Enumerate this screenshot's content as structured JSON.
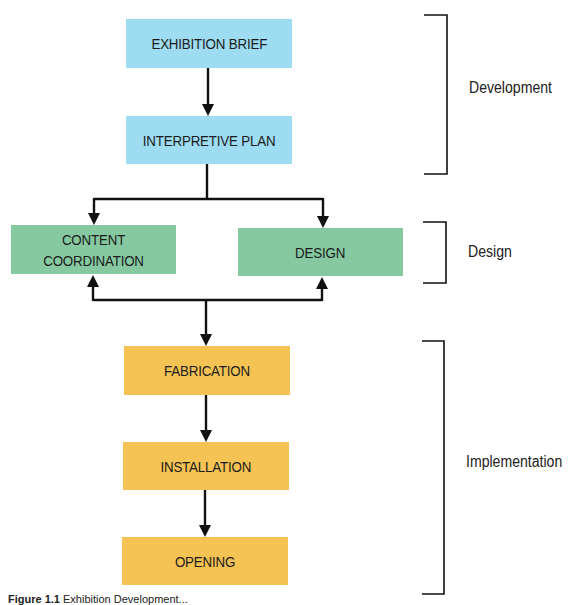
{
  "diagram": {
    "nodes": [
      {
        "id": "exhibition-brief",
        "label": "EXHIBITION BRIEF",
        "color": "#9edcf2"
      },
      {
        "id": "interpretive-plan",
        "label": "INTERPRETIVE PLAN",
        "color": "#9edcf2"
      },
      {
        "id": "content-coordination",
        "label": "CONTENT\nCOORDINATION",
        "color": "#86c9a1"
      },
      {
        "id": "design",
        "label": "DESIGN",
        "color": "#86c9a1"
      },
      {
        "id": "fabrication",
        "label": "FABRICATION",
        "color": "#f5c353"
      },
      {
        "id": "installation",
        "label": "INSTALLATION",
        "color": "#f5c353"
      },
      {
        "id": "opening",
        "label": "OPENING",
        "color": "#f5c353"
      }
    ],
    "edges": [
      {
        "from": "exhibition-brief",
        "to": "interpretive-plan"
      },
      {
        "from": "interpretive-plan",
        "to": "content-coordination"
      },
      {
        "from": "interpretive-plan",
        "to": "design"
      },
      {
        "from": "fabrication",
        "to": "content-coordination"
      },
      {
        "from": "fabrication",
        "to": "design"
      },
      {
        "from": "content-coordination",
        "to": "fabrication"
      },
      {
        "from": "design",
        "to": "fabrication"
      },
      {
        "from": "fabrication",
        "to": "installation"
      },
      {
        "from": "installation",
        "to": "opening"
      }
    ],
    "phases": [
      {
        "label": "Development",
        "spans": [
          "exhibition-brief",
          "interpretive-plan"
        ]
      },
      {
        "label": "Design",
        "spans": [
          "content-coordination",
          "design"
        ]
      },
      {
        "label": "Implementation",
        "spans": [
          "fabrication",
          "installation",
          "opening"
        ]
      }
    ]
  },
  "caption": {
    "label": "Figure 1.1",
    "text": "Exhibition Development..."
  }
}
